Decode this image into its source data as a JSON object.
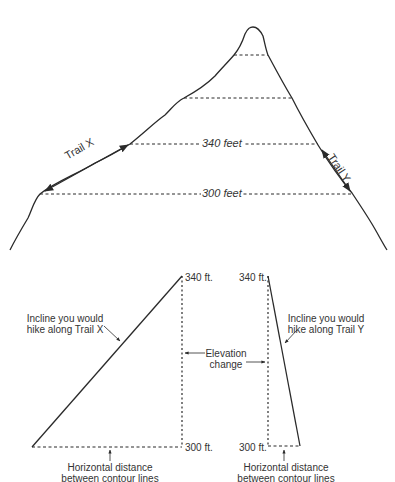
{
  "mountain": {
    "contour_labels": [
      "340 feet",
      "300 feet"
    ],
    "trails": [
      {
        "label": "Trail X",
        "side": "left",
        "slope": "gentle"
      },
      {
        "label": "Trail Y",
        "side": "right",
        "slope": "steep"
      }
    ]
  },
  "profile_x": {
    "top_label": "340 ft.",
    "bottom_label": "300 ft.",
    "incline_label_line1": "Incline you would",
    "incline_label_line2": "hike along Trail X",
    "horizontal_label_line1": "Horizontal distance",
    "horizontal_label_line2": "between contour lines"
  },
  "profile_y": {
    "top_label": "340 ft.",
    "bottom_label": "300 ft.",
    "incline_label_line1": "Incline you would",
    "incline_label_line2": "hike along Trail Y",
    "horizontal_label_line1": "Horizontal distance",
    "horizontal_label_line2": "between contour lines"
  },
  "elevation_change": {
    "line1": "Elevation",
    "line2": "change"
  },
  "colors": {
    "line": "#2a2a2a",
    "background": "#ffffff"
  }
}
